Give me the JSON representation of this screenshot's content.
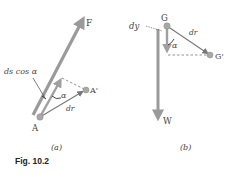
{
  "figure": {
    "caption": "Fig. 10.2",
    "panels": [
      {
        "id": "a",
        "label": "(a)",
        "force_label": "F",
        "point_label": "A",
        "point_prime_label": "A'",
        "displacement_label": "dr",
        "angle_label": "α",
        "projection_label": "ds cos α"
      },
      {
        "id": "b",
        "label": "(b)",
        "force_label": "W",
        "point_label": "G",
        "point_prime_label": "G'",
        "displacement_label": "dr",
        "angle_label": "α",
        "vertical_label": "dy"
      }
    ]
  },
  "colors": {
    "force_arrow": "#9a9a9a",
    "displacement_arrow": "#888888",
    "point": "#a8a8a8",
    "dashed": "#777777",
    "text": "#444444"
  }
}
